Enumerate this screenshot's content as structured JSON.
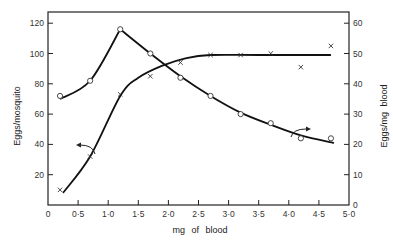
{
  "chart_data": {
    "type": "line",
    "title": "",
    "xlabel": "mg of blood",
    "ylabel": "Eggs/mosquito",
    "ylabel_right": "Eggs/mg blood",
    "xlim": [
      0,
      5.0
    ],
    "ylim": [
      0,
      130
    ],
    "ylim_right": [
      0,
      65
    ],
    "grid": false,
    "legend": "none (arrows indicate axis for each curve)",
    "x_ticks": [
      "0",
      "0·5",
      "1·0",
      "1·5",
      "2·0",
      "2·5",
      "3·0",
      "3·5",
      "4·0",
      "4·5",
      "5·0"
    ],
    "y_ticks_left": [
      "20",
      "40",
      "60",
      "80",
      "100",
      "120"
    ],
    "y_ticks_right": [
      "0",
      "10",
      "20",
      "30",
      "40",
      "50",
      "60"
    ],
    "series": [
      {
        "name": "Eggs/mosquito",
        "marker": "x",
        "axis": "left",
        "points": [
          [
            0.2,
            10
          ],
          [
            0.7,
            32
          ],
          [
            1.2,
            73
          ],
          [
            1.7,
            85
          ],
          [
            2.2,
            94
          ],
          [
            2.7,
            99
          ],
          [
            3.2,
            99
          ],
          [
            3.7,
            100
          ],
          [
            4.2,
            91
          ],
          [
            4.7,
            105
          ]
        ],
        "curve": [
          [
            0.25,
            8
          ],
          [
            0.7,
            32
          ],
          [
            1.2,
            72
          ],
          [
            1.5,
            84
          ],
          [
            1.9,
            92
          ],
          [
            2.3,
            97
          ],
          [
            2.7,
            99
          ],
          [
            3.5,
            99
          ],
          [
            4.7,
            99
          ]
        ]
      },
      {
        "name": "Eggs/mg blood",
        "marker": "o",
        "axis": "right",
        "points": [
          [
            0.2,
            36
          ],
          [
            0.7,
            41
          ],
          [
            1.2,
            58
          ],
          [
            1.7,
            50
          ],
          [
            2.2,
            42
          ],
          [
            2.7,
            36
          ],
          [
            3.2,
            30
          ],
          [
            3.7,
            27
          ],
          [
            4.2,
            22
          ],
          [
            4.7,
            22
          ]
        ],
        "curve": [
          [
            0.2,
            35
          ],
          [
            0.7,
            41
          ],
          [
            1.2,
            58
          ],
          [
            1.7,
            50
          ],
          [
            2.2,
            42.5
          ],
          [
            2.7,
            36
          ],
          [
            3.2,
            30.5
          ],
          [
            3.7,
            26.5
          ],
          [
            4.2,
            23
          ],
          [
            4.75,
            20.5
          ]
        ]
      }
    ]
  }
}
